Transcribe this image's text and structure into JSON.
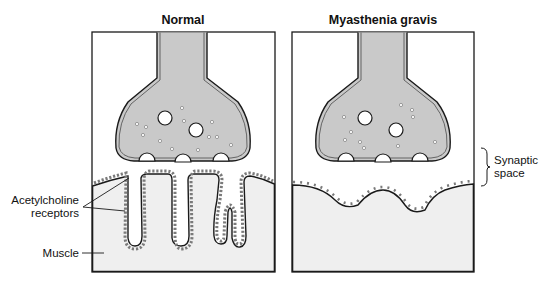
{
  "figure": {
    "panels": [
      {
        "id": "normal",
        "title": "Normal"
      },
      {
        "id": "myasthenia",
        "title": "Myasthenia gravis"
      }
    ],
    "labels": {
      "receptors_line1": "Acetylcholine",
      "receptors_line2": "receptors",
      "muscle": "Muscle",
      "synaptic_line1": "Synaptic",
      "synaptic_line2": "space"
    },
    "colors": {
      "terminal_fill": "#c9c9c9",
      "muscle_fill": "#efefef",
      "outline": "#1a1a1a",
      "receptor_dot": "#7a7a7a",
      "background": "#ffffff"
    }
  }
}
